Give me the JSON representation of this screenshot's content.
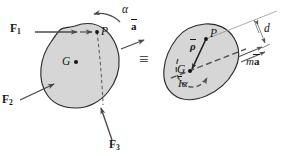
{
  "figure": {
    "background_color": "#ffffff",
    "body_fill_color": "#d6d6d6",
    "body_stroke_color": "#2b2b2b",
    "arrow_color": "#4a4a4a",
    "text_color": "#161616",
    "dashed_color": "#565656"
  },
  "left_diagram": {
    "name": "free-body-diagram",
    "forces": [
      {
        "id": "F1",
        "base": "F",
        "subscript": "1",
        "label": "F1",
        "direction": "right"
      },
      {
        "id": "F2",
        "base": "F",
        "subscript": "2",
        "label": "F2",
        "direction": "up-right"
      },
      {
        "id": "F3",
        "base": "F",
        "subscript": "3",
        "label": "F3",
        "direction": "up-left"
      }
    ],
    "points": [
      {
        "id": "P",
        "label": "P"
      },
      {
        "id": "G",
        "label": "G"
      }
    ],
    "angular_acceleration": {
      "symbol": "α",
      "label": "α",
      "sense": "counterclockwise"
    },
    "dashed_line": "line through P and body edge"
  },
  "equivalence": {
    "symbol": "≡",
    "label": "≡"
  },
  "acceleration_label": {
    "base": "a",
    "label": "a",
    "overbar": true,
    "description": "a-bar acceleration vector of mass center"
  },
  "right_diagram": {
    "name": "effective-force-diagram",
    "points": [
      {
        "id": "P",
        "label": "P"
      },
      {
        "id": "G",
        "label": "G"
      }
    ],
    "vectors": [
      {
        "id": "rho",
        "base": "ρ",
        "label": "ρ",
        "overbar": true,
        "description": "position vector rho-bar from P to G"
      },
      {
        "id": "ma",
        "prefix": "m",
        "base": "a",
        "label": "a",
        "prefix_label": "m",
        "overbar": true,
        "description": "m a-bar effective force"
      }
    ],
    "couple": {
      "base": "I",
      "suffix": "α",
      "label": "I",
      "suffix_label": "α",
      "overbar": true,
      "description": "I-bar alpha effective couple",
      "sense": "counterclockwise"
    },
    "dimension": {
      "symbol": "d",
      "label": "d",
      "description": "perpendicular distance d from P to line of action of m a-bar"
    }
  }
}
